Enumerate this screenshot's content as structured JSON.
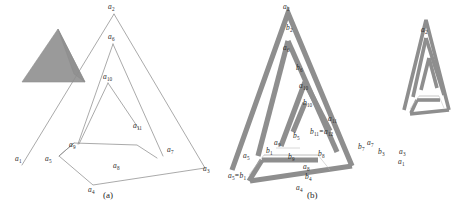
{
  "figure": {
    "background": "#ffffff",
    "ink_color": "#8a8a8a",
    "label_color": "#2b2b2b",
    "solid_fill": "#9a9a9a",
    "band_fill": "#8e8e8e"
  },
  "panel_a": {
    "caption": "(a)",
    "labels": [
      {
        "id": "a1",
        "text": "a",
        "sub": "1"
      },
      {
        "id": "a2",
        "text": "a",
        "sub": "2"
      },
      {
        "id": "a3",
        "text": "a",
        "sub": "3"
      },
      {
        "id": "a4",
        "text": "a",
        "sub": "4"
      },
      {
        "id": "a5",
        "text": "a",
        "sub": "5"
      },
      {
        "id": "a6",
        "text": "a",
        "sub": "6"
      },
      {
        "id": "a7",
        "text": "a",
        "sub": "7"
      },
      {
        "id": "a8",
        "text": "a",
        "sub": "8"
      },
      {
        "id": "a9",
        "text": "a",
        "sub": "9"
      },
      {
        "id": "a10",
        "text": "a",
        "sub": "10"
      },
      {
        "id": "a11",
        "text": "a",
        "sub": "11"
      }
    ]
  },
  "panel_b": {
    "caption": "(b)",
    "labels": [
      {
        "id": "a2",
        "text": "a",
        "sub": "2"
      },
      {
        "id": "b2",
        "text": "b",
        "sub": "2"
      },
      {
        "id": "a6",
        "text": "a",
        "sub": "6"
      },
      {
        "id": "b6",
        "text": "b",
        "sub": "6"
      },
      {
        "id": "a10",
        "text": "a",
        "sub": "10"
      },
      {
        "id": "b10",
        "text": "b",
        "sub": "10"
      },
      {
        "id": "a11",
        "text": "a",
        "sub": "11"
      },
      {
        "id": "b11eq",
        "text": "b",
        "sub": "11",
        "equals": "a",
        "equals_sub": "12"
      },
      {
        "id": "a1",
        "text": "a",
        "sub": "1"
      },
      {
        "id": "a3",
        "text": "a",
        "sub": "3"
      },
      {
        "id": "a4",
        "text": "a",
        "sub": "4"
      },
      {
        "id": "a5",
        "text": "a",
        "sub": "5"
      },
      {
        "id": "a7",
        "text": "a",
        "sub": "7"
      },
      {
        "id": "a8",
        "text": "a",
        "sub": "8"
      },
      {
        "id": "a9",
        "text": "a",
        "sub": "9"
      },
      {
        "id": "b1",
        "text": "b",
        "sub": "1"
      },
      {
        "id": "b3",
        "text": "b",
        "sub": "3"
      },
      {
        "id": "b4",
        "text": "b",
        "sub": "4"
      },
      {
        "id": "b5",
        "text": "b",
        "sub": "5"
      },
      {
        "id": "b7",
        "text": "b",
        "sub": "7"
      },
      {
        "id": "b8",
        "text": "b",
        "sub": "8"
      },
      {
        "id": "b9",
        "text": "b",
        "sub": "9"
      },
      {
        "id": "a5eqb1",
        "text": "a",
        "sub": "5",
        "equals": "b",
        "equals_sub": "1"
      }
    ],
    "inset": {
      "label": {
        "id": "a2i",
        "text": "a",
        "sub": "2"
      }
    }
  }
}
